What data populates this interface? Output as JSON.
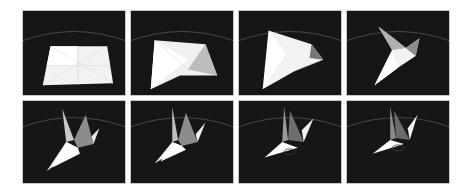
{
  "figure": {
    "layout": {
      "rows": 2,
      "columns": 4
    },
    "colors": {
      "background": "#161616",
      "paper": "#f2f2f2",
      "shadow": "#8a8a8a",
      "horizon": "#5a5a5a",
      "page": "#ffffff"
    },
    "panels": [
      {
        "step": 1,
        "state": "flat-sheet"
      },
      {
        "step": 2,
        "state": "partially-folded-sheet"
      },
      {
        "step": 3,
        "state": "bird-base-forming"
      },
      {
        "step": 4,
        "state": "wings-lifting"
      },
      {
        "step": 5,
        "state": "crane-wings-raised"
      },
      {
        "step": 6,
        "state": "crane-wings-raised"
      },
      {
        "step": 7,
        "state": "crane-settling"
      },
      {
        "step": 8,
        "state": "crane-complete"
      }
    ]
  }
}
